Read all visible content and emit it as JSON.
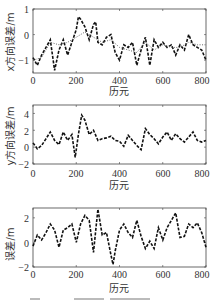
{
  "chart_data": [
    {
      "type": "line",
      "title": "",
      "xlabel": "历元",
      "ylabel": "x方向误差/m",
      "xlim": [
        0,
        800
      ],
      "ylim": [
        -1.5,
        1
      ],
      "xticks": [
        0,
        200,
        400,
        600,
        800
      ],
      "yticks": [
        -1,
        0,
        1
      ],
      "grid": false,
      "series": [
        {
          "name": "dashed",
          "style": "dashed",
          "x": [
            0,
            20,
            40,
            60,
            80,
            100,
            120,
            140,
            160,
            180,
            200,
            210,
            220,
            240,
            260,
            280,
            290,
            300,
            320,
            340,
            360,
            380,
            400,
            420,
            440,
            460,
            480,
            500,
            520,
            540,
            560,
            580,
            600,
            620,
            640,
            660,
            680,
            700,
            720,
            740,
            760,
            780,
            800
          ],
          "y": [
            -0.9,
            -1.2,
            -0.8,
            -0.5,
            -0.2,
            -1.4,
            -0.6,
            -0.2,
            -0.8,
            -0.3,
            0.2,
            0.7,
            0.6,
            0.3,
            -0.2,
            0.4,
            0.5,
            -0.3,
            -0.4,
            -0.1,
            0.0,
            -0.7,
            -1.0,
            -0.4,
            -0.5,
            -0.3,
            -1.2,
            -0.6,
            -0.1,
            -1.2,
            -0.2,
            -0.5,
            -0.3,
            -0.5,
            -0.4,
            -0.8,
            -0.4,
            -0.6,
            0.0,
            -0.4,
            -0.5,
            -0.6,
            -1.0
          ]
        },
        {
          "name": "dotted",
          "style": "dotted",
          "x": [
            0,
            40,
            80,
            120,
            160,
            200,
            240,
            280,
            320,
            360,
            400,
            440,
            480,
            520,
            560,
            600,
            640,
            680,
            720,
            760,
            800
          ],
          "y": [
            -1.0,
            -0.9,
            -0.3,
            -0.4,
            -0.3,
            -0.1,
            0.1,
            -0.1,
            -0.3,
            -0.2,
            -0.5,
            -0.6,
            -0.7,
            -0.3,
            -0.6,
            -0.4,
            -0.5,
            -0.5,
            -0.3,
            -0.4,
            -0.4
          ]
        }
      ]
    },
    {
      "type": "line",
      "title": "",
      "xlabel": "历元",
      "ylabel": "y方向误差/m",
      "xlim": [
        0,
        800
      ],
      "ylim": [
        -2,
        5
      ],
      "xticks": [
        0,
        200,
        400,
        600,
        800
      ],
      "yticks": [
        -2,
        0,
        2,
        4
      ],
      "grid": false,
      "series": [
        {
          "name": "dashed",
          "style": "dashed",
          "x": [
            0,
            20,
            40,
            60,
            80,
            100,
            120,
            140,
            160,
            180,
            195,
            210,
            225,
            240,
            260,
            280,
            300,
            320,
            340,
            360,
            380,
            400,
            420,
            440,
            460,
            480,
            500,
            520,
            540,
            560,
            580,
            600,
            620,
            640,
            660,
            680,
            700,
            720,
            740,
            760,
            780,
            800
          ],
          "y": [
            0.5,
            -0.2,
            0.2,
            1.0,
            1.8,
            0.8,
            0.3,
            1.8,
            0.8,
            1.5,
            -1.2,
            1.5,
            3.8,
            3.2,
            1.5,
            2.0,
            0.8,
            1.0,
            1.1,
            1.3,
            0.8,
            0.7,
            0.1,
            1.4,
            0.8,
            0.2,
            -0.3,
            2.2,
            1.5,
            1.0,
            0.4,
            1.2,
            1.8,
            0.8,
            1.6,
            1.0,
            0.6,
            1.2,
            1.8,
            0.8,
            0.6,
            0.8
          ]
        }
      ]
    },
    {
      "type": "line",
      "title": "",
      "xlabel": "历元",
      "ylabel": "误差/m",
      "xlim": [
        0,
        800
      ],
      "ylim": [
        -2,
        2.8
      ],
      "xticks": [
        0,
        200,
        400,
        600,
        800
      ],
      "yticks": [
        -2,
        0,
        2
      ],
      "grid": false,
      "series": [
        {
          "name": "dashed",
          "style": "dashed",
          "x": [
            0,
            20,
            40,
            60,
            80,
            100,
            120,
            140,
            160,
            180,
            200,
            220,
            240,
            260,
            280,
            300,
            320,
            340,
            360,
            370,
            380,
            400,
            420,
            440,
            460,
            480,
            500,
            520,
            540,
            560,
            580,
            600,
            620,
            640,
            660,
            680,
            700,
            720,
            740,
            760,
            780,
            800
          ],
          "y": [
            -0.3,
            0.6,
            0.2,
            0.8,
            1.5,
            1.0,
            -0.4,
            1.0,
            1.2,
            1.5,
            0.0,
            1.5,
            2.2,
            1.8,
            -0.8,
            2.7,
            0.6,
            0.8,
            -1.0,
            -1.8,
            -0.7,
            1.0,
            1.5,
            0.8,
            0.4,
            1.8,
            0.5,
            -0.5,
            0.1,
            -0.5,
            1.2,
            0.2,
            1.2,
            1.8,
            2.4,
            0.4,
            0.5,
            1.5,
            1.2,
            1.6,
            0.8,
            -0.4
          ]
        }
      ]
    }
  ],
  "panels": [
    {
      "ylabel": "x方向误差/m",
      "xlabel": "历元",
      "xtick_labels": [
        "0",
        "200",
        "400",
        "600",
        "800"
      ],
      "ytick_labels": [
        "1",
        "0",
        "−1"
      ]
    },
    {
      "ylabel": "y方向误差/m",
      "xlabel": "历元",
      "xtick_labels": [
        "0",
        "200",
        "400",
        "600",
        "800"
      ],
      "ytick_labels": [
        "4",
        "2",
        "0",
        "−2"
      ]
    },
    {
      "ylabel": "误差/m",
      "xlabel": "历元",
      "xtick_labels": [
        "0",
        "200",
        "400",
        "600",
        "800"
      ],
      "ytick_labels": [
        "2",
        "0",
        "−2"
      ]
    }
  ]
}
